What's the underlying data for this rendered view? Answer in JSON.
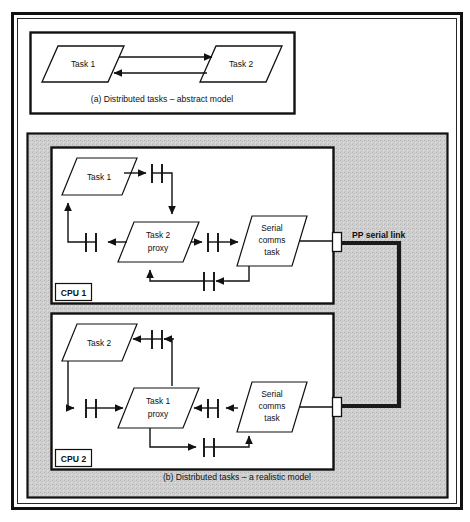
{
  "figure": {
    "outer_frame": "double-rule figure border",
    "panel_a": {
      "caption": "(a) Distributed tasks – abstract model",
      "nodes": [
        {
          "id": "a-task1",
          "label": "Task 1",
          "shape": "parallelogram"
        },
        {
          "id": "a-task2",
          "label": "Task 2",
          "shape": "parallelogram"
        }
      ],
      "arrows": [
        {
          "from": "a-task1",
          "to": "a-task2",
          "direction": "right"
        },
        {
          "from": "a-task2",
          "to": "a-task1",
          "direction": "left"
        }
      ]
    },
    "panel_b": {
      "caption": "(b) Distributed tasks – a realistic model",
      "background": "#cfcfcf",
      "link_label": "PP serial link",
      "cpus": [
        {
          "id": "cpu1",
          "label": "CPU 1",
          "nodes": [
            {
              "id": "c1-task1",
              "label": "Task 1"
            },
            {
              "id": "c1-proxy",
              "label_line1": "Task 2",
              "label_line2": "proxy"
            },
            {
              "id": "c1-serial",
              "label_line1": "Serial",
              "label_line2": "comms",
              "label_line3": "task"
            }
          ],
          "queues": 4
        },
        {
          "id": "cpu2",
          "label": "CPU 2",
          "nodes": [
            {
              "id": "c2-task2",
              "label": "Task 2"
            },
            {
              "id": "c2-proxy",
              "label_line1": "Task 1",
              "label_line2": "proxy"
            },
            {
              "id": "c2-serial",
              "label_line1": "Serial",
              "label_line2": "comms",
              "label_line3": "task"
            }
          ],
          "queues": 4
        }
      ]
    }
  },
  "colors": {
    "ink": "#111111",
    "paper": "#ffffff",
    "panel_b_fill": "#cfcfcf",
    "link_line": "#1a1a1a"
  }
}
